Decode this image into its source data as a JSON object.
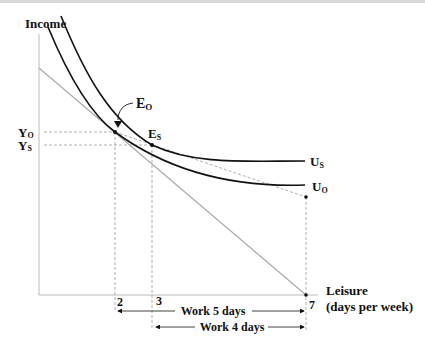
{
  "diagram": {
    "y_axis_label": "Income",
    "x_axis_label_line1": "Leisure",
    "x_axis_label_line2": "(days per week)",
    "points": {
      "eo": {
        "label": "E",
        "sub": "O"
      },
      "es": {
        "label": "E",
        "sub": "S"
      }
    },
    "y_ticks": [
      {
        "label": "Y",
        "sub": "O"
      },
      {
        "label": "Y",
        "sub": "S"
      }
    ],
    "x_ticks": [
      "2",
      "3",
      "7"
    ],
    "curves": [
      {
        "label": "U",
        "sub": "S"
      },
      {
        "label": "U",
        "sub": "O"
      }
    ],
    "spans": [
      {
        "label": "Work 5 days",
        "from": 2,
        "to": 7
      },
      {
        "label": "Work 4 days",
        "from": 3,
        "to": 7
      }
    ],
    "colors": {
      "curve": "#111111",
      "budget": "#aaaaaa",
      "dashed": "#999999"
    }
  }
}
